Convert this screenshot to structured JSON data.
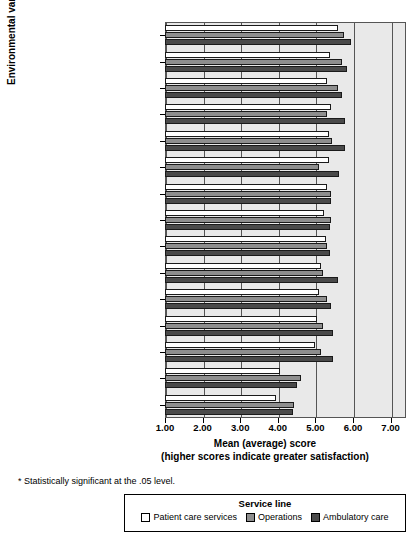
{
  "chart_data": {
    "type": "bar",
    "orientation": "horizontal",
    "title": "",
    "xlabel": "Mean (average) score",
    "xlabel_line2": "(higher scores indicate greater satisfaction)",
    "ylabel": "Environmental variable",
    "xlim": [
      1.0,
      7.5
    ],
    "xticks": [
      "1.00",
      "2.00",
      "3.00",
      "4.00",
      "5.00",
      "6.00",
      "7.00"
    ],
    "xtick_values": [
      1,
      2,
      3,
      4,
      5,
      6,
      7
    ],
    "grid": true,
    "legend_position": "bottom",
    "legend_title": "Service line",
    "categories": [
      "Job satisfaction *",
      "Pride in the organization *",
      "Participative management *",
      "Professional patient care *",
      "Relationship w/coworkers *",
      "Relationship w/nurses *",
      "Professional growth",
      "Executive leadership",
      "Relationship w/physicians",
      "HES total score *",
      "Staffing/scheduling",
      "Autonomy",
      "Intent to stay *",
      "Distributive justice *",
      "Workload *"
    ],
    "series": [
      {
        "name": "Patient care services",
        "color": "#ffffff",
        "values": [
          5.6,
          5.4,
          5.32,
          5.42,
          5.35,
          5.35,
          5.32,
          5.22,
          5.27,
          5.15,
          5.1,
          5.05,
          5.0,
          4.05,
          3.95
        ]
      },
      {
        "name": "Operations",
        "color": "#8e8e8e",
        "values": [
          5.75,
          5.7,
          5.6,
          5.3,
          5.45,
          5.1,
          5.42,
          5.42,
          5.32,
          5.2,
          5.3,
          5.2,
          5.15,
          4.62,
          4.42
        ]
      },
      {
        "name": "Ambulatory care",
        "color": "#4a4a4a",
        "values": [
          5.95,
          5.85,
          5.7,
          5.8,
          5.8,
          5.62,
          5.42,
          5.4,
          5.4,
          5.6,
          5.42,
          5.47,
          5.47,
          4.52,
          4.4
        ]
      }
    ],
    "footnote": "* Statistically significant at the .05 level."
  }
}
